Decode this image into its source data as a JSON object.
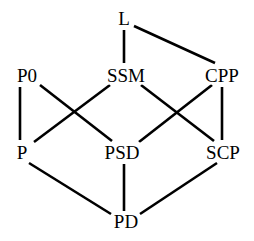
{
  "figure": {
    "kind": "hasse-diagram",
    "title": "",
    "background_color": "#ffffff",
    "edge_color": "#000000",
    "label_color": "#000000",
    "edge_width": 2.6,
    "width": 254,
    "height": 241
  },
  "chart_data": {
    "type": "diagram",
    "subtype": "hasse-lattice",
    "title": "",
    "xlabel": "",
    "ylabel": "",
    "grid": false,
    "legend": false,
    "levels": [
      {
        "index": 0,
        "y": 18,
        "nodes": [
          "L"
        ]
      },
      {
        "index": 1,
        "y": 75,
        "nodes": [
          "P0",
          "SSM",
          "CPP"
        ]
      },
      {
        "index": 2,
        "y": 152,
        "nodes": [
          "P",
          "PSD",
          "SCP"
        ]
      },
      {
        "index": 3,
        "y": 221,
        "nodes": [
          "PD"
        ]
      }
    ],
    "nodes": [
      {
        "id": "L",
        "label": "L",
        "x": 124,
        "y": 18,
        "level": 0
      },
      {
        "id": "P0",
        "label": "P0",
        "x": 27,
        "y": 75,
        "level": 1
      },
      {
        "id": "SSM",
        "label": "SSM",
        "x": 126,
        "y": 75,
        "level": 1
      },
      {
        "id": "CPP",
        "label": "CPP",
        "x": 222,
        "y": 75,
        "level": 1
      },
      {
        "id": "P",
        "label": "P",
        "x": 22,
        "y": 152,
        "level": 2
      },
      {
        "id": "PSD",
        "label": "PSD",
        "x": 122,
        "y": 152,
        "level": 2
      },
      {
        "id": "SCP",
        "label": "SCP",
        "x": 223,
        "y": 152,
        "level": 2
      },
      {
        "id": "PD",
        "label": "PD",
        "x": 126,
        "y": 221,
        "level": 3
      }
    ],
    "edges": [
      {
        "from": "L",
        "to": "SSM",
        "x1": 124,
        "y1": 30,
        "x2": 124,
        "y2": 63
      },
      {
        "from": "L",
        "to": "CPP",
        "x1": 134,
        "y1": 26,
        "x2": 215,
        "y2": 63
      },
      {
        "from": "P0",
        "to": "P",
        "x1": 20,
        "y1": 87,
        "x2": 20,
        "y2": 140
      },
      {
        "from": "P0",
        "to": "PSD",
        "x1": 40,
        "y1": 85,
        "x2": 112,
        "y2": 141
      },
      {
        "from": "SSM",
        "to": "P",
        "x1": 110,
        "y1": 85,
        "x2": 34,
        "y2": 142
      },
      {
        "from": "SSM",
        "to": "SCP",
        "x1": 141,
        "y1": 85,
        "x2": 214,
        "y2": 141
      },
      {
        "from": "CPP",
        "to": "PSD",
        "x1": 212,
        "y1": 85,
        "x2": 139,
        "y2": 142
      },
      {
        "from": "CPP",
        "to": "SCP",
        "x1": 222,
        "y1": 87,
        "x2": 222,
        "y2": 140
      },
      {
        "from": "P",
        "to": "PD",
        "x1": 29,
        "y1": 163,
        "x2": 111,
        "y2": 214
      },
      {
        "from": "PSD",
        "to": "PD",
        "x1": 124,
        "y1": 164,
        "x2": 124,
        "y2": 211
      },
      {
        "from": "SCP",
        "to": "PD",
        "x1": 217,
        "y1": 163,
        "x2": 140,
        "y2": 214
      }
    ]
  }
}
